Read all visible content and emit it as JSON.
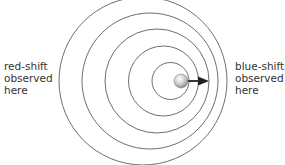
{
  "diagram": {
    "wavefronts": [
      {
        "cx": 143,
        "cy": 81,
        "r": 84
      },
      {
        "cx": 150,
        "cy": 81,
        "r": 68
      },
      {
        "cx": 157,
        "cy": 81,
        "r": 52
      },
      {
        "cx": 163.5,
        "cy": 81,
        "r": 35
      },
      {
        "cx": 170.5,
        "cy": 81,
        "r": 18.5
      }
    ],
    "source": {
      "cx": 182,
      "cy": 81,
      "r": 7,
      "icon": "sphere-icon"
    },
    "motion_arrow": {
      "from_x": 186,
      "to_x": 208,
      "y": 81,
      "icon": "arrow-right-icon"
    },
    "colors": {
      "wavefront": "#6e6e6e",
      "arrow": "#222222",
      "text": "#333333"
    }
  },
  "labels": {
    "left": {
      "line1": "red-shift",
      "line2": "observed",
      "line3": "here"
    },
    "right": {
      "line1": "blue-shift",
      "line2": "observed",
      "line3": "here"
    }
  }
}
